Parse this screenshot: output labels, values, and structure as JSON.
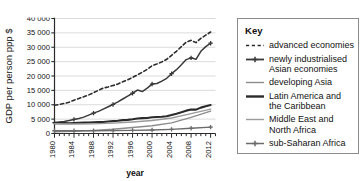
{
  "chart_data": {
    "type": "line",
    "title": "",
    "xlabel": "year",
    "ylabel": "GDP per person ppp $",
    "xlim": [
      1980,
      2013
    ],
    "ylim": [
      0,
      40000
    ],
    "grid": true,
    "legend_position": "right",
    "legend_title": "Key",
    "y_ticks": [
      "0",
      "5 000",
      "10 000",
      "15 000",
      "20 000",
      "25 000",
      "30 000",
      "35 000",
      "40 000"
    ],
    "y_tick_values": [
      0,
      5000,
      10000,
      15000,
      20000,
      25000,
      30000,
      35000,
      40000
    ],
    "x_ticks": [
      "1980",
      "1984",
      "1988",
      "1992",
      "1996",
      "2000",
      "2004",
      "2008",
      "2012"
    ],
    "x_tick_values": [
      1980,
      1984,
      1988,
      1992,
      1996,
      2000,
      2004,
      2008,
      2012
    ],
    "x_minor_step": 1,
    "series": [
      {
        "name": "advanced economies",
        "style": "dashed",
        "color": "#2b2b2b",
        "width": 1.6,
        "markers": false,
        "x": [
          1980,
          1981,
          1982,
          1983,
          1984,
          1985,
          1986,
          1987,
          1988,
          1989,
          1990,
          1991,
          1992,
          1993,
          1994,
          1995,
          1996,
          1997,
          1998,
          1999,
          2000,
          2001,
          2002,
          2003,
          2004,
          2005,
          2006,
          2007,
          2008,
          2009,
          2010,
          2011,
          2012
        ],
        "values": [
          9800,
          10100,
          10450,
          10900,
          11600,
          12200,
          12800,
          13400,
          14200,
          15000,
          15800,
          16200,
          16700,
          17200,
          18000,
          18700,
          19500,
          20400,
          21300,
          22300,
          23600,
          24200,
          24900,
          25800,
          27200,
          28600,
          30200,
          31800,
          32400,
          31600,
          33100,
          34200,
          35300
        ]
      },
      {
        "name": "newly industrialised Asian economies",
        "style": "solid",
        "color": "#3a3a3a",
        "width": 1.5,
        "markers": true,
        "x": [
          1980,
          1981,
          1982,
          1983,
          1984,
          1985,
          1986,
          1987,
          1988,
          1989,
          1990,
          1991,
          1992,
          1993,
          1994,
          1995,
          1996,
          1997,
          1998,
          1999,
          2000,
          2001,
          2002,
          2003,
          2004,
          2005,
          2006,
          2007,
          2008,
          2009,
          2010,
          2011,
          2012
        ],
        "values": [
          3800,
          4000,
          4200,
          4500,
          4900,
          5200,
          5700,
          6400,
          7100,
          7700,
          8500,
          9300,
          10100,
          11000,
          12000,
          13000,
          14000,
          15100,
          14600,
          15800,
          17200,
          17400,
          18200,
          19200,
          20800,
          22200,
          23900,
          25700,
          26300,
          25800,
          28600,
          30200,
          31400
        ]
      },
      {
        "name": "developing Asia",
        "style": "solid",
        "color": "#8c8c8c",
        "width": 1.4,
        "markers": false,
        "x": [
          1980,
          1984,
          1988,
          1992,
          1996,
          2000,
          2004,
          2008,
          2012
        ],
        "values": [
          600,
          800,
          1100,
          1500,
          2100,
          2700,
          3700,
          5600,
          7800
        ]
      },
      {
        "name": "Latin America and the Caribbean",
        "style": "solid",
        "color": "#2b2b2b",
        "width": 2.1,
        "markers": false,
        "x": [
          1980,
          1981,
          1982,
          1983,
          1984,
          1985,
          1986,
          1987,
          1988,
          1989,
          1990,
          1991,
          1992,
          1993,
          1994,
          1995,
          1996,
          1997,
          1998,
          1999,
          2000,
          2001,
          2002,
          2003,
          2004,
          2005,
          2006,
          2007,
          2008,
          2009,
          2010,
          2011,
          2012
        ],
        "values": [
          3600,
          3650,
          3600,
          3550,
          3650,
          3750,
          3800,
          3850,
          3900,
          3950,
          4000,
          4150,
          4300,
          4450,
          4650,
          4750,
          4950,
          5200,
          5350,
          5400,
          5650,
          5750,
          5850,
          6000,
          6450,
          6900,
          7400,
          7950,
          8350,
          8300,
          9000,
          9500,
          9900
        ]
      },
      {
        "name": "Middle East and North Africa",
        "style": "solid",
        "color": "#9a9a9a",
        "width": 1.4,
        "markers": false,
        "x": [
          1980,
          1984,
          1988,
          1992,
          1996,
          2000,
          2004,
          2008,
          2012
        ],
        "values": [
          3400,
          3300,
          3350,
          3600,
          4000,
          4500,
          5400,
          6900,
          8500
        ]
      },
      {
        "name": "sub-Saharan Africa",
        "style": "solid",
        "color": "#6b6b6b",
        "width": 1.4,
        "markers": true,
        "x": [
          1980,
          1984,
          1988,
          1992,
          1996,
          2000,
          2004,
          2008,
          2012
        ],
        "values": [
          950,
          950,
          980,
          1000,
          1100,
          1200,
          1450,
          1800,
          2200
        ]
      }
    ]
  },
  "legend": {
    "title": "Key",
    "items": [
      {
        "label": "advanced economies",
        "style": "dashed",
        "color": "#2b2b2b",
        "width": 1.6,
        "markers": false
      },
      {
        "label": "newly industrialised\nAsian economies",
        "style": "solid",
        "color": "#3a3a3a",
        "width": 1.8,
        "markers": true
      },
      {
        "label": "developing Asia",
        "style": "solid",
        "color": "#8c8c8c",
        "width": 1.4,
        "markers": false
      },
      {
        "label": "Latin America and\nthe Caribbean",
        "style": "solid",
        "color": "#2b2b2b",
        "width": 2.4,
        "markers": false
      },
      {
        "label": "Middle East and\nNorth Africa",
        "style": "solid",
        "color": "#9a9a9a",
        "width": 1.4,
        "markers": false
      },
      {
        "label": "sub-Saharan Africa",
        "style": "solid",
        "color": "#6b6b6b",
        "width": 1.5,
        "markers": true
      }
    ]
  }
}
